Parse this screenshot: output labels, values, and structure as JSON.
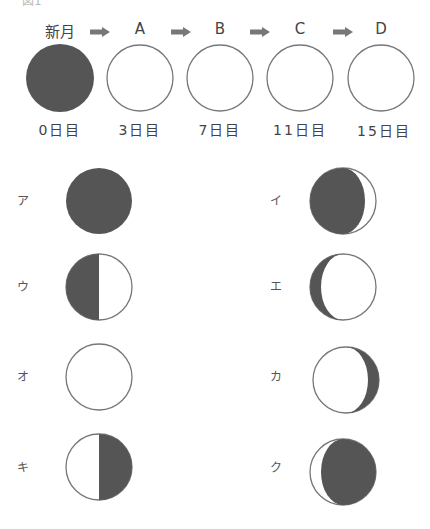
{
  "figure": {
    "caption": "図1",
    "colors": {
      "shadow": "#555555",
      "outline": "#777777",
      "lit": "#ffffff",
      "arrow": "#777777"
    }
  },
  "sequence": {
    "stages": [
      {
        "top": "新月",
        "bottom": "0日目",
        "phase": "new"
      },
      {
        "top": "A",
        "bottom": "3日目",
        "phase": "blank"
      },
      {
        "top": "B",
        "bottom": "7日目",
        "phase": "blank"
      },
      {
        "top": "C",
        "bottom": "11日目",
        "phase": "blank"
      },
      {
        "top": "D",
        "bottom": "15日目",
        "phase": "blank"
      }
    ],
    "arrow_icon": "right-arrow"
  },
  "choices": [
    {
      "label": "ア",
      "phase": "full-dark"
    },
    {
      "label": "イ",
      "phase": "dark-with-right-thin-crescent"
    },
    {
      "label": "ウ",
      "phase": "left-half-dark"
    },
    {
      "label": "エ",
      "phase": "left-thin-dark-crescent"
    },
    {
      "label": "オ",
      "phase": "full-white"
    },
    {
      "label": "カ",
      "phase": "right-thin-dark-crescent"
    },
    {
      "label": "キ",
      "phase": "right-half-dark"
    },
    {
      "label": "ク",
      "phase": "dark-with-left-thin-crescent"
    }
  ]
}
